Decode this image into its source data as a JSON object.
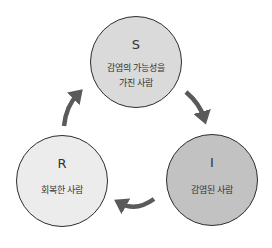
{
  "diagram": {
    "type": "SIR cycle",
    "nodes": [
      {
        "id": "S",
        "letter": "S",
        "label_line1": "감염의 가능성을",
        "label_line2": "가진 사람",
        "fill": "#dadada"
      },
      {
        "id": "I",
        "letter": "I",
        "label_line1": "감염된 사람",
        "fill": "#c2c2c2"
      },
      {
        "id": "R",
        "letter": "R",
        "label_line1": "회복한 사람",
        "fill": "#ececec"
      }
    ],
    "edges": [
      {
        "from": "S",
        "to": "I"
      },
      {
        "from": "I",
        "to": "R"
      },
      {
        "from": "R",
        "to": "S"
      }
    ],
    "arrow_color": "#5a5a5a",
    "border_color": "#2e2e2e"
  }
}
